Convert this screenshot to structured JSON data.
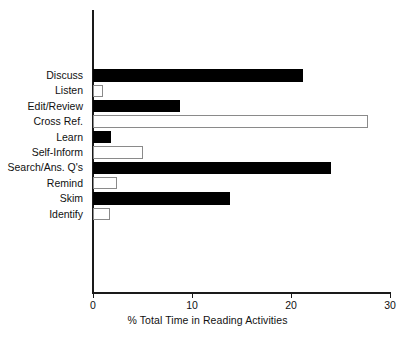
{
  "chart_data": {
    "type": "bar",
    "orientation": "horizontal",
    "title": "",
    "xlabel": "% Total Time in Reading Activities",
    "ylabel": "",
    "xlim": [
      0,
      30
    ],
    "xticks": [
      0,
      10,
      20,
      30
    ],
    "xtick_labels": [
      "0",
      "10",
      "20",
      "30"
    ],
    "grid": false,
    "legend": null,
    "categories": [
      "Discuss",
      "Listen",
      "Edit/Review",
      "Cross Ref.",
      "Learn",
      "Self-Inform",
      "Search/Ans. Q's",
      "Remind",
      "Skim",
      "Identify"
    ],
    "values": [
      21.2,
      1.0,
      8.8,
      27.8,
      1.8,
      5.0,
      24.0,
      2.4,
      13.8,
      1.7
    ],
    "bar_styles": [
      "filled",
      "open",
      "filled",
      "open",
      "filled",
      "open",
      "filled",
      "open",
      "filled",
      "open"
    ],
    "colors": {
      "filled": "#000000",
      "open_fill": "#ffffff",
      "open_stroke": "#8a8a8a",
      "axis": "#1a1a1a",
      "text": "#111111",
      "background": "#ffffff"
    }
  }
}
